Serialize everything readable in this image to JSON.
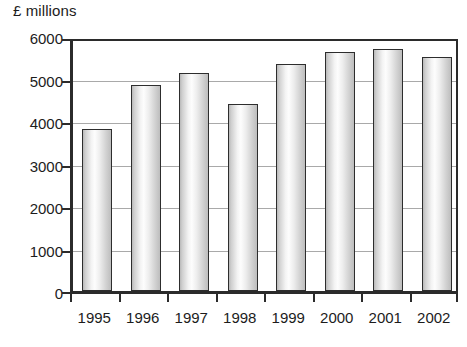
{
  "chart_data": {
    "type": "bar",
    "title": "",
    "subtitle": "",
    "xlabel": "",
    "ylabel": "£ millions",
    "categories": [
      "1995",
      "1996",
      "1997",
      "1998",
      "1999",
      "2000",
      "2001",
      "2002"
    ],
    "values": [
      3820,
      4850,
      5140,
      4400,
      5350,
      5630,
      5700,
      5500
    ],
    "series": [
      {
        "name": "£ millions",
        "values": [
          3820,
          4850,
          5140,
          4400,
          5350,
          5630,
          5700,
          5500
        ]
      }
    ],
    "ylim": [
      0,
      6000
    ],
    "ytick_labels": [
      "6000",
      "5000",
      "4000",
      "3000",
      "2000",
      "1000",
      "0"
    ],
    "ytick_values": [
      6000,
      5000,
      4000,
      3000,
      2000,
      1000,
      0
    ],
    "grid": true,
    "grid_axis": "y",
    "legend": false,
    "legend_position": "none",
    "bar_style": "cylinder-gradient",
    "colors": {
      "bar_fill_light": "#fdfdfd",
      "bar_fill_mid": "#dcdcdc",
      "bar_fill_dark": "#b9b9b9",
      "bar_outline": "#2d2d2d",
      "axis": "#2b2b2b",
      "gridline": "#a9a9a9",
      "text": "#1c1c1c",
      "background": "#ffffff"
    }
  }
}
